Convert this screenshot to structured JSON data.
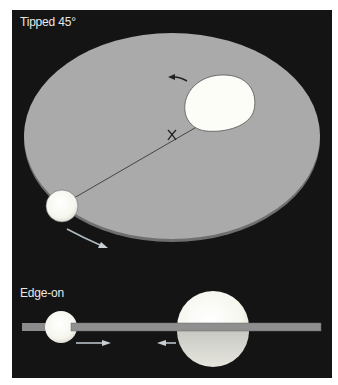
{
  "figure": {
    "panels": [
      {
        "id": "tipped",
        "label": "Tipped 45°",
        "elements": {
          "disk": "orbital plane disk (tilted)",
          "large_body": "large sphere on disk",
          "small_body": "small sphere at disk edge",
          "center_of_mass_marker": "X",
          "motion_arrows": [
            "counter-clockwise arrow near large body",
            "arrow below small body"
          ]
        }
      },
      {
        "id": "edge_on",
        "label": "Edge-on",
        "elements": {
          "plane_bar": "orbital plane seen edge-on",
          "small_body": "small sphere",
          "large_body": "large sphere",
          "motion_arrows": [
            "right-pointing arrow under small body",
            "left-pointing arrow near large body"
          ]
        }
      }
    ],
    "colors": {
      "background": "#141414",
      "disk": "#a9a9a9",
      "disk_rim": "#7d7d7d",
      "sphere": "#fbfbf5",
      "sphere_shade": "#cfcfcf",
      "text": "#e8e8e8",
      "arrow_light": "#b8c2c8",
      "arrow_dark": "#2a2a2a"
    },
    "marker": "X"
  }
}
